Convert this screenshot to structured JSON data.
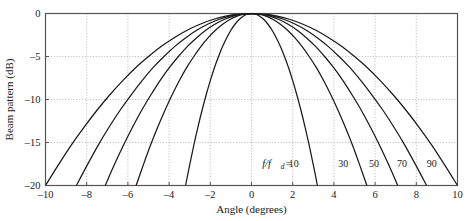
{
  "chart_data": {
    "type": "line",
    "title": "",
    "xlabel": "Angle (degrees)",
    "ylabel": "Beam pattern (dB)",
    "xlim": [
      -10,
      10
    ],
    "ylim": [
      -20,
      0
    ],
    "xticks": [
      -10,
      -8,
      -6,
      -4,
      -2,
      0,
      2,
      4,
      6,
      8,
      10
    ],
    "xticklabels": [
      "-10",
      "-8",
      "-6",
      "-4",
      "-2",
      "0",
      "2",
      "4",
      "6",
      "8",
      "10"
    ],
    "yticks": [
      0,
      -5,
      -10,
      -15,
      -20
    ],
    "yticklabels": [
      "0",
      "-5",
      "-10",
      "-15",
      "-20"
    ],
    "grid": true,
    "grid_style": "dotted",
    "legend_position": "inline-at-curves",
    "series_label_prefix": "f/f",
    "series_label_subscript": "d",
    "series_label_equals": "=",
    "line_color": "#1a1a1a",
    "grid_color": "#9a9a9a",
    "axis_color": "#555555",
    "background": "#ffffff",
    "series": [
      {
        "name": "10",
        "label": "10",
        "label_x": 2.05,
        "label_y": -17.6,
        "halfwidth_3db": 0.95,
        "x": [
          -3.2,
          -3.0,
          -2.8,
          -2.6,
          -2.4,
          -2.2,
          -2.0,
          -1.8,
          -1.6,
          -1.4,
          -1.2,
          -1.0,
          -0.8,
          -0.6,
          -0.4,
          -0.2,
          0.0,
          0.2,
          0.4,
          0.6,
          0.8,
          1.0,
          1.2,
          1.4,
          1.6,
          1.8,
          2.0,
          2.2,
          2.4,
          2.6,
          2.8,
          3.0,
          3.2
        ],
        "values": [
          -20.0,
          -17.6,
          -15.3,
          -13.2,
          -11.25,
          -9.45,
          -7.8,
          -6.3,
          -5.0,
          -3.82,
          -2.81,
          -1.95,
          -1.25,
          -0.7,
          -0.31,
          -0.08,
          0.0,
          -0.08,
          -0.31,
          -0.7,
          -1.25,
          -1.95,
          -2.81,
          -3.82,
          -5.0,
          -6.3,
          -7.8,
          -9.45,
          -11.25,
          -13.2,
          -15.3,
          -17.6,
          -20.0
        ]
      },
      {
        "name": "30",
        "label": "30",
        "label_x": 4.45,
        "label_y": -17.6,
        "halfwidth_3db": 1.66,
        "x": [
          -5.6,
          -5.25,
          -4.9,
          -4.55,
          -4.2,
          -3.85,
          -3.5,
          -3.15,
          -2.8,
          -2.45,
          -2.1,
          -1.75,
          -1.4,
          -1.05,
          -0.7,
          -0.35,
          0.0,
          0.35,
          0.7,
          1.05,
          1.4,
          1.75,
          2.1,
          2.45,
          2.8,
          3.15,
          3.5,
          3.85,
          4.2,
          4.55,
          4.9,
          5.25,
          5.6
        ],
        "values": [
          -20.0,
          -17.6,
          -15.3,
          -13.2,
          -11.25,
          -9.45,
          -7.8,
          -6.3,
          -5.0,
          -3.82,
          -2.81,
          -1.95,
          -1.25,
          -0.7,
          -0.31,
          -0.08,
          0.0,
          -0.08,
          -0.31,
          -0.7,
          -1.25,
          -1.95,
          -2.81,
          -3.82,
          -5.0,
          -6.3,
          -7.8,
          -9.45,
          -11.25,
          -13.2,
          -15.3,
          -17.6,
          -20.0
        ]
      },
      {
        "name": "50",
        "label": "50",
        "label_x": 5.95,
        "label_y": -17.6,
        "halfwidth_3db": 2.11,
        "x": [
          -7.1,
          -6.66,
          -6.21,
          -5.77,
          -5.33,
          -4.88,
          -4.44,
          -3.99,
          -3.55,
          -3.11,
          -2.66,
          -2.22,
          -1.78,
          -1.33,
          -0.89,
          -0.44,
          0.0,
          0.44,
          0.89,
          1.33,
          1.78,
          2.22,
          2.66,
          3.11,
          3.55,
          3.99,
          4.44,
          4.88,
          5.33,
          5.77,
          6.21,
          6.66,
          7.1
        ],
        "values": [
          -20.0,
          -17.6,
          -15.3,
          -13.2,
          -11.25,
          -9.45,
          -7.8,
          -6.3,
          -5.0,
          -3.82,
          -2.81,
          -1.95,
          -1.25,
          -0.7,
          -0.31,
          -0.08,
          0.0,
          -0.08,
          -0.31,
          -0.7,
          -1.25,
          -1.95,
          -2.81,
          -3.82,
          -5.0,
          -6.3,
          -7.8,
          -9.45,
          -11.25,
          -13.2,
          -15.3,
          -17.6,
          -20.0
        ]
      },
      {
        "name": "70",
        "label": "70",
        "label_x": 7.3,
        "label_y": -17.6,
        "halfwidth_3db": 2.53,
        "x": [
          -8.5,
          -7.97,
          -7.44,
          -6.91,
          -6.38,
          -5.84,
          -5.31,
          -4.78,
          -4.25,
          -3.72,
          -3.19,
          -2.66,
          -2.13,
          -1.59,
          -1.06,
          -0.53,
          0.0,
          0.53,
          1.06,
          1.59,
          2.13,
          2.66,
          3.19,
          3.72,
          4.25,
          4.78,
          5.31,
          5.84,
          6.38,
          6.91,
          7.44,
          7.97,
          8.5
        ],
        "values": [
          -20.0,
          -17.6,
          -15.3,
          -13.2,
          -11.25,
          -9.45,
          -7.8,
          -6.3,
          -5.0,
          -3.82,
          -2.81,
          -1.95,
          -1.25,
          -0.7,
          -0.31,
          -0.08,
          0.0,
          -0.08,
          -0.31,
          -0.7,
          -1.25,
          -1.95,
          -2.81,
          -3.82,
          -5.0,
          -6.3,
          -7.8,
          -9.45,
          -11.25,
          -13.2,
          -15.3,
          -17.6,
          -20.0
        ]
      },
      {
        "name": "90",
        "label": "90",
        "label_x": 8.75,
        "label_y": -17.6,
        "halfwidth_3db": 2.98,
        "x": [
          -10.0,
          -9.375,
          -8.75,
          -8.125,
          -7.5,
          -6.875,
          -6.25,
          -5.625,
          -5.0,
          -4.375,
          -3.75,
          -3.125,
          -2.5,
          -1.875,
          -1.25,
          -0.625,
          0.0,
          0.625,
          1.25,
          1.875,
          2.5,
          3.125,
          3.75,
          4.375,
          5.0,
          5.625,
          6.25,
          6.875,
          7.5,
          8.125,
          8.75,
          9.375,
          10.0
        ],
        "values": [
          -20.0,
          -17.6,
          -15.3,
          -13.2,
          -11.25,
          -9.45,
          -7.8,
          -6.3,
          -5.0,
          -3.82,
          -2.81,
          -1.95,
          -1.25,
          -0.7,
          -0.31,
          -0.08,
          0.0,
          -0.08,
          -0.31,
          -0.7,
          -1.25,
          -1.95,
          -2.81,
          -3.82,
          -5.0,
          -6.3,
          -7.8,
          -9.45,
          -11.25,
          -13.2,
          -15.3,
          -17.6,
          -20.0
        ]
      }
    ]
  }
}
